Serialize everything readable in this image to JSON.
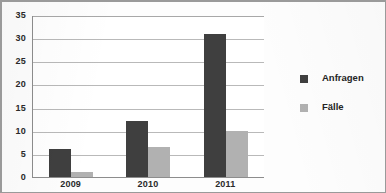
{
  "chart_data": {
    "type": "bar",
    "title": "",
    "xlabel": "",
    "ylabel": "",
    "categories": [
      "2009",
      "2010",
      "2011"
    ],
    "series": [
      {
        "name": "Anfragen",
        "color": "#3f3f3f",
        "values": [
          6,
          12,
          31
        ]
      },
      {
        "name": "Fälle",
        "color": "#b1b1b1",
        "values": [
          1,
          6.5,
          10
        ]
      }
    ],
    "ylim": [
      0,
      35
    ],
    "yticks": [
      0,
      5,
      10,
      15,
      20,
      25,
      30,
      35
    ],
    "ytick_labels": [
      "0",
      "5",
      "10",
      "15",
      "20",
      "25",
      "30",
      "35"
    ],
    "grid": true,
    "grid_axis": "y",
    "legend_position": "right",
    "background_color": "#ffffff",
    "axis_color": "#8d8d8d",
    "gridline_color": "#b9b9b9"
  },
  "legend": {
    "entries": [
      {
        "label": "Anfragen",
        "swatch": "legend-swatch-anfragen"
      },
      {
        "label": "Fälle",
        "swatch": "legend-swatch-faelle"
      }
    ]
  }
}
